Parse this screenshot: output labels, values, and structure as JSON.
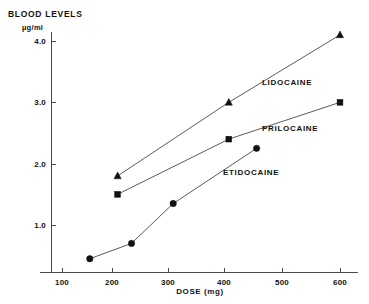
{
  "chart_data": {
    "type": "line",
    "title": "BLOOD LEVELS",
    "subtitle": "µg/ml",
    "xlabel": "DOSE (mg)",
    "ylabel": "BLOOD LEVELS µg/ml",
    "xlim": [
      0,
      650
    ],
    "ylim": [
      0,
      4.4
    ],
    "grid": false,
    "legend_position": "inline-annotations",
    "xticks": [
      100,
      200,
      300,
      400,
      500,
      600
    ],
    "xtick_labels": [
      "100",
      "200",
      "300",
      "400",
      "500",
      "600"
    ],
    "yticks": [
      1.0,
      2.0,
      3.0,
      4.0
    ],
    "ytick_labels": [
      "1.0",
      "2.0",
      "3.0",
      "4.0"
    ],
    "series": [
      {
        "name": "LIDOCAINE",
        "marker": "triangle",
        "color": "#111111",
        "x": [
          200,
          400,
          600
        ],
        "values": [
          1.8,
          3.0,
          4.1
        ]
      },
      {
        "name": "PRILOCAINE",
        "marker": "square",
        "color": "#111111",
        "x": [
          200,
          400,
          600
        ],
        "values": [
          1.5,
          2.4,
          3.0
        ]
      },
      {
        "name": "ETIDOCAINE",
        "marker": "circle",
        "color": "#111111",
        "x": [
          150,
          225,
          300,
          450
        ],
        "values": [
          0.45,
          0.7,
          1.35,
          2.25
        ]
      }
    ],
    "annotations": [
      {
        "text": "LIDOCAINE",
        "x": 460,
        "y": 3.35
      },
      {
        "text": "PRILOCAINE",
        "x": 460,
        "y": 2.45
      },
      {
        "text": "ETIDOCAINE",
        "x": 400,
        "y": 1.86
      }
    ]
  },
  "labels": {
    "title": "BLOOD LEVELS",
    "unit": "µg/ml",
    "xaxis_title": "DOSE (mg)",
    "x_100": "100",
    "x_200": "200",
    "x_300": "300",
    "x_400": "400",
    "x_500": "500",
    "x_600": "600",
    "y_1": "1.0",
    "y_2": "2.0",
    "y_3": "3.0",
    "y_4": "4.0",
    "series_lidocaine": "LIDOCAINE",
    "series_prilocaine": "PRILOCAINE",
    "series_etidocaine": "ETIDOCAINE"
  }
}
